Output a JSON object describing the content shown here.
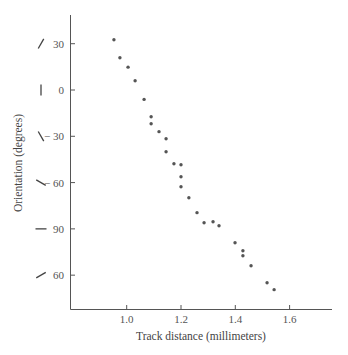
{
  "chart_data": {
    "type": "scatter",
    "title": "",
    "xlabel": "Track distance (millimeters)",
    "ylabel": "Orientation (degrees)",
    "xlim": [
      0.8,
      1.75
    ],
    "ylim": [
      -140,
      50
    ],
    "grid": false,
    "legend": null,
    "x_ticks": [
      {
        "value": 1.0,
        "label": "1.0"
      },
      {
        "value": 1.2,
        "label": "1.2"
      },
      {
        "value": 1.4,
        "label": "1.4"
      },
      {
        "value": 1.6,
        "label": "1.6"
      }
    ],
    "y_ticks": [
      {
        "value": 30,
        "label": "30",
        "glyph": "/",
        "glyph_angle": 30
      },
      {
        "value": 0,
        "label": "0",
        "glyph": "|",
        "glyph_angle": 0
      },
      {
        "value": -30,
        "label": "− 30",
        "glyph": "\\",
        "glyph_angle": -30
      },
      {
        "value": -60,
        "label": "− 60",
        "glyph": "/",
        "glyph_angle": -60
      },
      {
        "value": -90,
        "label": "90",
        "glyph": "—",
        "glyph_angle": 90
      },
      {
        "value": -120,
        "label": "60",
        "glyph": "\\",
        "glyph_angle": 60
      }
    ],
    "series": [
      {
        "name": "orientation",
        "points": [
          [
            0.953,
            32.6
          ],
          [
            0.975,
            20.9
          ],
          [
            1.005,
            14.8
          ],
          [
            1.031,
            6.0
          ],
          [
            1.064,
            -6.1
          ],
          [
            1.09,
            -17.3
          ],
          [
            1.09,
            -21.9
          ],
          [
            1.119,
            -27.0
          ],
          [
            1.145,
            -31.6
          ],
          [
            1.145,
            -40.0
          ],
          [
            1.174,
            -47.8
          ],
          [
            1.2,
            -48.4
          ],
          [
            1.2,
            -56.2
          ],
          [
            1.2,
            -62.7
          ],
          [
            1.229,
            -69.8
          ],
          [
            1.259,
            -79.5
          ],
          [
            1.285,
            -86.0
          ],
          [
            1.318,
            -85.4
          ],
          [
            1.34,
            -88.0
          ],
          [
            1.399,
            -99.0
          ],
          [
            1.428,
            -104.2
          ],
          [
            1.428,
            -107.4
          ],
          [
            1.458,
            -113.9
          ],
          [
            1.517,
            -124.9
          ],
          [
            1.543,
            -129.4
          ]
        ]
      }
    ]
  }
}
